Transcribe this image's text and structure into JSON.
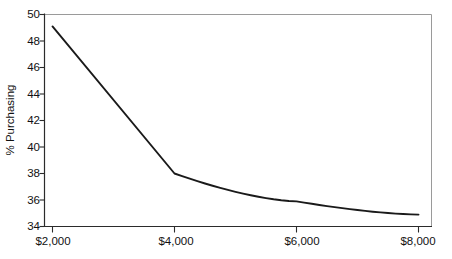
{
  "chart_data": {
    "type": "line",
    "title": "",
    "subtitle": "",
    "xlabel": "",
    "ylabel": "% Purchasing",
    "x": [
      2000,
      4000,
      6000,
      8000
    ],
    "categories": [
      "$2,000",
      "$4,000",
      "$6,000",
      "$8,000"
    ],
    "values": [
      49.1,
      38.0,
      35.9,
      34.9
    ],
    "series": [
      {
        "name": "% Purchasing",
        "values": [
          49.1,
          38.0,
          35.9,
          34.9
        ]
      }
    ],
    "xlim": [
      2000,
      8000
    ],
    "ylim": [
      34,
      50
    ],
    "ytick_values": [
      34,
      36,
      38,
      40,
      42,
      44,
      46,
      48,
      50
    ],
    "ytick_labels": [
      "34",
      "36",
      "38",
      "40",
      "42",
      "44",
      "46",
      "48",
      "50"
    ],
    "xtick_labels": [
      "$2,000",
      "$4,000",
      "$6,000",
      "$8,000"
    ],
    "grid": false,
    "legend": false,
    "legend_position": "none",
    "line_color": "#1a1a1a",
    "frame_color": "#9a9a9a",
    "axis_color": "#2b2b2b",
    "background_color": "#ffffff",
    "annotations": []
  },
  "axes": {
    "y_title": "% Purchasing",
    "y_ticks": [
      {
        "label": "50",
        "value": 50
      },
      {
        "label": "48",
        "value": 48
      },
      {
        "label": "46",
        "value": 46
      },
      {
        "label": "44",
        "value": 44
      },
      {
        "label": "42",
        "value": 42
      },
      {
        "label": "40",
        "value": 40
      },
      {
        "label": "38",
        "value": 38
      },
      {
        "label": "36",
        "value": 36
      },
      {
        "label": "34",
        "value": 34
      }
    ],
    "x_ticks": [
      {
        "label": "$2,000",
        "value": 2000
      },
      {
        "label": "$4,000",
        "value": 4000
      },
      {
        "label": "$6,000",
        "value": 6000
      },
      {
        "label": "$8,000",
        "value": 8000
      }
    ]
  }
}
